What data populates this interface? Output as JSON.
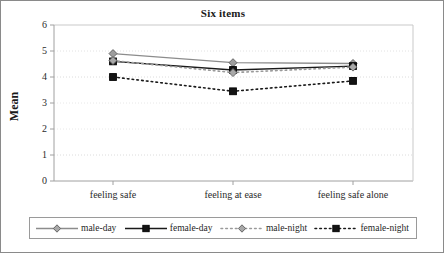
{
  "chart_data": {
    "type": "line",
    "title": "Six items",
    "xlabel": "",
    "ylabel": "Mean",
    "categories": [
      "feeling safe",
      "feeling at ease",
      "feeling safe alone"
    ],
    "ylim": [
      0,
      6
    ],
    "yticks": [
      0,
      1,
      2,
      3,
      4,
      5,
      6
    ],
    "ytick_labels": [
      "0",
      "1",
      "2",
      "3",
      "4",
      "5",
      "6"
    ],
    "grid": true,
    "legend_position": "bottom",
    "series": [
      {
        "name": "male-day",
        "values": [
          4.9,
          4.55,
          4.52
        ],
        "color": "#8c8c8c",
        "marker": "diamond",
        "linestyle": "solid"
      },
      {
        "name": "female-day",
        "values": [
          4.6,
          4.27,
          4.42
        ],
        "color": "#1a1a1a",
        "marker": "square",
        "linestyle": "solid"
      },
      {
        "name": "male-night",
        "values": [
          4.63,
          4.17,
          4.38
        ],
        "color": "#9a9a9a",
        "marker": "diamond",
        "linestyle": "dotted"
      },
      {
        "name": "female-night",
        "values": [
          4.0,
          3.45,
          3.85
        ],
        "color": "#1a1a1a",
        "marker": "square",
        "linestyle": "dotted"
      }
    ]
  },
  "legend": {
    "items": [
      {
        "label": "male-day"
      },
      {
        "label": "female-day"
      },
      {
        "label": "male-night"
      },
      {
        "label": "female-night"
      }
    ]
  }
}
